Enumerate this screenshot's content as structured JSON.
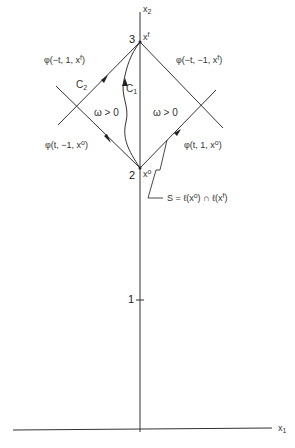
{
  "axes": {
    "x1_label": "x",
    "x1_sub": "1",
    "x2_label": "x",
    "x2_sub": "2",
    "tick_1": "1"
  },
  "points": {
    "top": {
      "number": "3",
      "label": "x",
      "sup": "f"
    },
    "bottom": {
      "number": "2",
      "label": "x",
      "sup": "o"
    }
  },
  "curves": {
    "c1": "C",
    "c1_sub": "1",
    "c2": "C",
    "c2_sub": "2"
  },
  "regions": {
    "left": "ω > 0",
    "right": "ω > 0"
  },
  "trajectories": {
    "upper_left": "φ(−t, 1, x",
    "upper_left_sup": "f",
    "upper_right": "φ(−t, −1, x",
    "upper_right_sup": "f",
    "lower_left": "φ(t, −1, x",
    "lower_left_sup": "o",
    "lower_right": "φ(t, 1, x",
    "lower_right_sup": "o",
    "close": ")"
  },
  "annotation": {
    "s_text": "S = ℓ(x",
    "s_sup1": "o",
    "s_mid": ") ∩ ℓ(x",
    "s_sup2": "f",
    "s_end": ")"
  }
}
